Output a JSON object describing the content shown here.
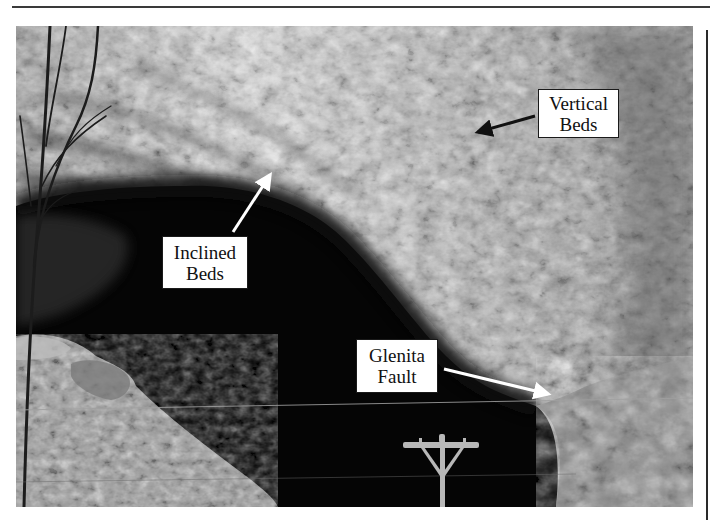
{
  "figure": {
    "colors": {
      "label_background": "#ffffff",
      "label_text": "#111111",
      "arrow_white": "#ffffff",
      "arrow_black": "#111111",
      "cave_dark": "#050505"
    },
    "labels": [
      {
        "id": "vertical-beds",
        "line1": "Vertical",
        "line2": "Beds",
        "box": {
          "x": 538,
          "y": 89,
          "w": 81,
          "h": 49
        },
        "arrow": {
          "color": "#111111",
          "from": [
            535,
            116
          ],
          "to": [
            474,
            133
          ]
        }
      },
      {
        "id": "inclined-beds",
        "line1": "Inclined",
        "line2": "Beds",
        "box": {
          "x": 162,
          "y": 236,
          "w": 86,
          "h": 53
        },
        "arrow": {
          "color": "#ffffff",
          "from": [
            233,
            232
          ],
          "to": [
            273,
            170
          ]
        }
      },
      {
        "id": "glenita-fault",
        "line1": "Glenita",
        "line2": "Fault",
        "box": {
          "x": 356,
          "y": 339,
          "w": 82,
          "h": 54
        },
        "arrow": {
          "color": "#ffffff",
          "from": [
            444,
            369
          ],
          "to": [
            553,
            395
          ]
        }
      }
    ]
  }
}
